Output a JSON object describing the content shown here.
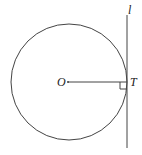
{
  "diagram": {
    "type": "circle-tangent-line",
    "labels": {
      "center": "O",
      "tangent_point": "T",
      "line": "l"
    },
    "colors": {
      "stroke": "#444444",
      "background": "#ffffff"
    },
    "geometry": {
      "center": [
        69,
        82
      ],
      "radius": 58,
      "tangent_x": 127,
      "line_y": [
        15,
        148
      ]
    },
    "annotations": [
      "right-angle marker at T"
    ]
  }
}
